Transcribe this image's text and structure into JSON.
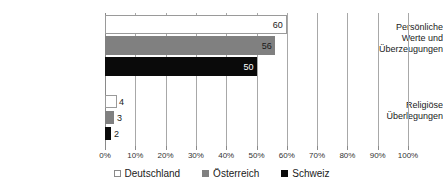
{
  "chart_data": {
    "type": "bar",
    "orientation": "horizontal",
    "title": "",
    "xlabel": "",
    "ylabel": "",
    "xlim": [
      0,
      100
    ],
    "grid": true,
    "legend_position": "bottom",
    "categories": [
      "Persönliche Werte und Überzeugungen",
      "Religiöse Überlegungen"
    ],
    "category_lines": [
      [
        "Persönliche",
        "Werte und",
        "Überzeugungen"
      ],
      [
        "Religiöse",
        "Überlegungen"
      ]
    ],
    "series": [
      {
        "name": "Deutschland",
        "color": "#ffffff",
        "values": [
          60,
          4
        ]
      },
      {
        "name": "Österreich",
        "color": "#808080",
        "values": [
          56,
          3
        ]
      },
      {
        "name": "Schweiz",
        "color": "#0a0a0a",
        "values": [
          50,
          2
        ]
      }
    ],
    "value_labels": [
      [
        "60",
        "56",
        "50"
      ],
      [
        "4",
        "3",
        "2"
      ]
    ],
    "tick_labels": [
      "0%",
      "10%",
      "20%",
      "30%",
      "40%",
      "50%",
      "60%",
      "70%",
      "80%",
      "90%",
      "100%"
    ],
    "tick_values": [
      0,
      10,
      20,
      30,
      40,
      50,
      60,
      70,
      80,
      90,
      100
    ]
  },
  "legend": {
    "items": [
      {
        "label": "Deutschland",
        "swatch": "legend-swatch-deutschland"
      },
      {
        "label": "Österreich",
        "swatch": "legend-swatch-oesterreich"
      },
      {
        "label": "Schweiz",
        "swatch": "legend-swatch-schweiz"
      }
    ]
  }
}
